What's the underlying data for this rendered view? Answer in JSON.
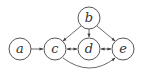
{
  "diagram": {
    "type": "directed-graph",
    "nodes": [
      {
        "id": "a",
        "label": "a",
        "x": 20,
        "y": 49
      },
      {
        "id": "c",
        "label": "c",
        "x": 55,
        "y": 49
      },
      {
        "id": "d",
        "label": "d",
        "x": 89,
        "y": 49
      },
      {
        "id": "b",
        "label": "b",
        "x": 89,
        "y": 18
      },
      {
        "id": "e",
        "label": "e",
        "x": 123,
        "y": 49
      }
    ],
    "edges": [
      {
        "from": "a",
        "to": "c",
        "direction": "forward"
      },
      {
        "from": "b",
        "to": "c",
        "direction": "forward"
      },
      {
        "from": "b",
        "to": "d",
        "direction": "forward"
      },
      {
        "from": "b",
        "to": "e",
        "direction": "forward"
      },
      {
        "from": "c",
        "to": "d",
        "direction": "both"
      },
      {
        "from": "d",
        "to": "e",
        "direction": "both"
      },
      {
        "from": "c",
        "to": "e",
        "direction": "forward",
        "curved": true
      }
    ],
    "colors": {
      "stroke": "#444444",
      "background": "#ffffff"
    }
  }
}
